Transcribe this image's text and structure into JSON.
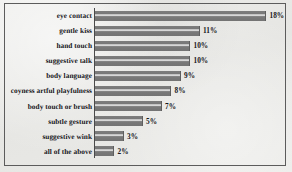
{
  "chart_data": {
    "type": "bar",
    "orientation": "horizontal",
    "title": "",
    "xlabel": "",
    "ylabel": "",
    "grid": false,
    "legend": null,
    "value_suffix": "%",
    "xlim": [
      0,
      18
    ],
    "categories": [
      "eye contact",
      "gentle kiss",
      "hand touch",
      "suggestive talk",
      "body language",
      "coyness artful playfulness",
      "body touch or brush",
      "subtle gesture",
      "suggestive wink",
      "all of the above"
    ],
    "values": [
      18,
      11,
      10,
      10,
      9,
      8,
      7,
      5,
      3,
      2
    ],
    "data_labels": [
      "18%",
      "11%",
      "10%",
      "10%",
      "9%",
      "8%",
      "7%",
      "5%",
      "3%",
      "2%"
    ]
  },
  "style": {
    "bar_color": "#7a7a7a",
    "border_color": "#5c5c5c",
    "text_color": "#16161a",
    "background": "#e8e8e6"
  }
}
